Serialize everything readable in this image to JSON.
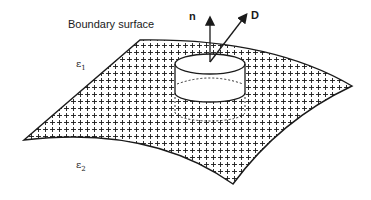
{
  "figure": {
    "title": "Boundary surface",
    "regions": {
      "upper_medium": {
        "symbol": "ε",
        "subscript": "1"
      },
      "lower_medium": {
        "symbol": "ε",
        "subscript": "2"
      }
    },
    "vectors": {
      "normal": "n",
      "displacement": "D"
    },
    "elements": [
      "curved boundary surface with + charge pattern",
      "pillbox cylinder straddling surface",
      "normal vector n",
      "displacement vector D"
    ],
    "colors": {
      "stroke": "#1a1a1a",
      "background": "#ffffff"
    }
  }
}
